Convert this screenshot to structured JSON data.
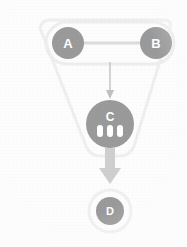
{
  "diagram": {
    "title": "",
    "type": "flowchart",
    "background_color": "#fdfdfd",
    "node_fill_color": "#9a9a9a",
    "node_text_color": "#ffffff",
    "edge_color": "#d9d9d9",
    "container_outline_color": "#ededed",
    "nodes": [
      {
        "id": "A",
        "label": "A",
        "shape": "circle",
        "cx": 68,
        "cy": 43,
        "r": 16,
        "fill": "#9a9a9a"
      },
      {
        "id": "B",
        "label": "B",
        "shape": "circle",
        "cx": 156,
        "cy": 43,
        "r": 16,
        "fill": "#9a9a9a"
      },
      {
        "id": "C",
        "label": "C",
        "shape": "circle",
        "cx": 110,
        "cy": 124,
        "r": 24,
        "fill": "#9a9a9a",
        "badge_bars": 3,
        "badge_bar_color": "#ffffff"
      },
      {
        "id": "D",
        "label": "D",
        "shape": "circle",
        "cx": 110,
        "cy": 211,
        "r": 14,
        "fill": "#9a9a9a",
        "halo_ring_color": "#f0f0f0",
        "halo_ring_r": 21
      }
    ],
    "edges": [
      {
        "id": "edge-a-b",
        "from": "A",
        "to": "B",
        "style": "plain-line",
        "arrow": "none",
        "color": "#dcdcdc"
      },
      {
        "id": "edge-ab-c",
        "from": "A-B",
        "to": "C",
        "style": "thin-arrow",
        "arrow": "single",
        "color": "#c9c9c9"
      },
      {
        "id": "edge-c-d",
        "from": "C",
        "to": "D",
        "style": "block-arrow",
        "arrow": "single",
        "color": "#cfcfcf"
      }
    ],
    "containers": [
      {
        "id": "group-ab",
        "label": "",
        "shape": "rounded-rect",
        "x": 46,
        "y": 22,
        "width": 128,
        "height": 42,
        "radius": 21,
        "stroke": "#eeeeee"
      },
      {
        "id": "group-abc",
        "label": "",
        "shape": "rounded-triangle",
        "stroke": "#efefef"
      }
    ]
  }
}
